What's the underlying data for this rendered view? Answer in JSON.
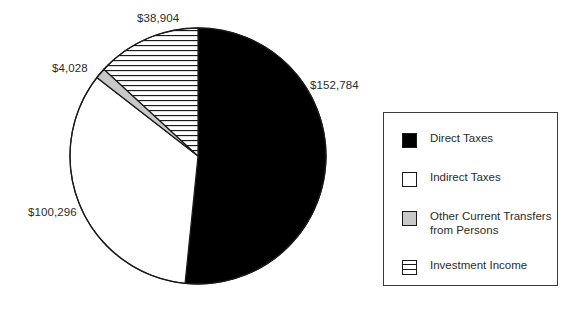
{
  "chart_data": {
    "type": "pie",
    "title": "",
    "subtitle": "",
    "xlabel": "",
    "ylabel": "",
    "currency_symbol": "$",
    "total": 296012,
    "categories": [
      "Direct Taxes",
      "Indirect Taxes",
      "Other Current Transfers from Persons",
      "Investment Income"
    ],
    "values": [
      152784,
      100296,
      4028,
      38904
    ],
    "labels": [
      "$152,784",
      "$100,296",
      "$4,028",
      "$38,904"
    ],
    "slice_fills": [
      "solid-black",
      "white",
      "light-gray",
      "horizontal-hatch"
    ],
    "colors": [
      "#000000",
      "#ffffff",
      "#c8c8c8",
      "#ffffff"
    ],
    "outline_color": "#1a1a1a",
    "start_angle_deg": 0,
    "direction": "clockwise",
    "legend_position": "right",
    "grid": false
  },
  "pie": {
    "center_x": 198,
    "center_y": 156,
    "radius": 128,
    "labels": {
      "top": "$38,904",
      "right": "$152,784",
      "left": "$100,296",
      "small": "$4,028"
    }
  },
  "legend": {
    "items": [
      {
        "label": "Direct Taxes",
        "swatch": "solid-black-swatch"
      },
      {
        "label": "Indirect Taxes",
        "swatch": "white-swatch"
      },
      {
        "label": "Other Current Transfers\nfrom Persons",
        "swatch": "gray-swatch"
      },
      {
        "label": "Investment Income",
        "swatch": "hatched-swatch"
      }
    ]
  }
}
